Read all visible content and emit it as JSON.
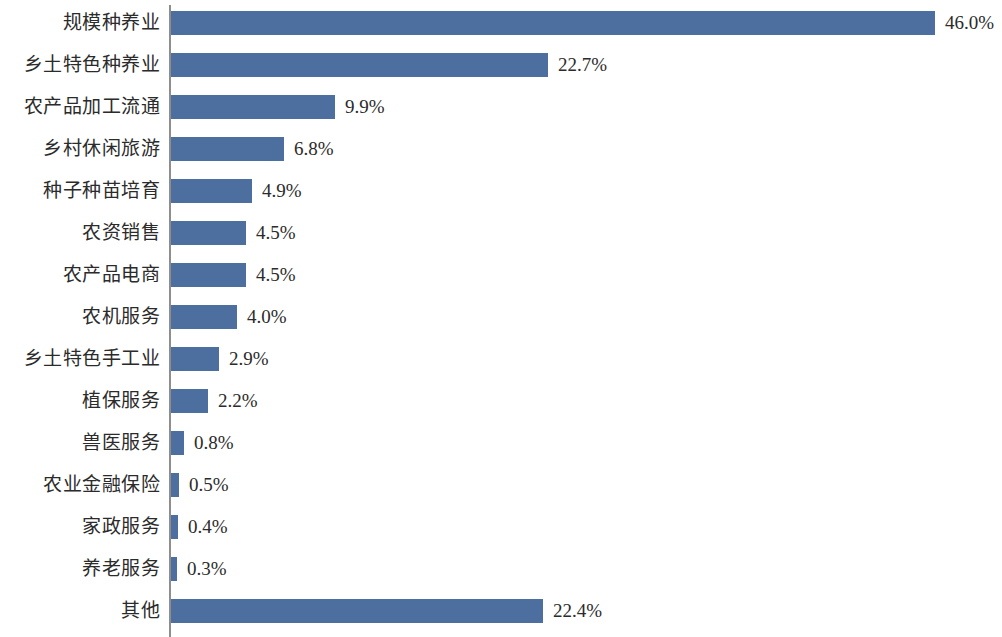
{
  "chart_data": {
    "type": "bar",
    "orientation": "horizontal",
    "title": "",
    "subtitle": "",
    "xlabel": "",
    "ylabel": "",
    "grid": false,
    "legend": null,
    "legend_position": "none",
    "value_suffix": "%",
    "xlim": [
      0,
      46.0
    ],
    "bar_color": "#4d6f9f",
    "axis_color": "#8e8e8e",
    "background_color": "#ffffff",
    "categories": [
      "规模种养业",
      "乡土特色种养业",
      "农产品加工流通",
      "乡村休闲旅游",
      "种子种苗培育",
      "农资销售",
      "农产品电商",
      "农机服务",
      "乡土特色手工业",
      "植保服务",
      "兽医服务",
      "农业金融保险",
      "家政服务",
      "养老服务",
      "其他"
    ],
    "values": [
      46.0,
      22.7,
      9.9,
      6.8,
      4.9,
      4.5,
      4.5,
      4.0,
      2.9,
      2.2,
      0.8,
      0.5,
      0.4,
      0.3,
      22.4
    ],
    "value_labels": [
      "46.0%",
      "22.7%",
      "9.9%",
      "6.8%",
      "4.9%",
      "4.5%",
      "4.5%",
      "4.0%",
      "2.9%",
      "2.2%",
      "0.8%",
      "0.5%",
      "0.4%",
      "0.3%",
      "22.4%"
    ]
  }
}
